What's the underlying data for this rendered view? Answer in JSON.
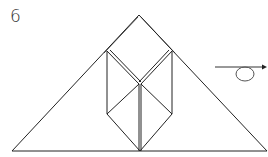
{
  "step": {
    "number": "6"
  },
  "diagram": {
    "stroke_color": "#222222",
    "background": "#ffffff",
    "symbols": [
      {
        "name": "turn-over-symbol",
        "meaning": "Turn the model over"
      }
    ]
  }
}
